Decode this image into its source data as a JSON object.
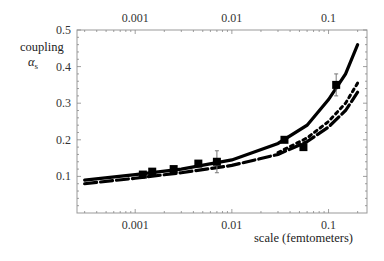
{
  "chart_data": {
    "type": "line",
    "title": "",
    "xlabel": "scale (femtometers)",
    "ylabel": "coupling",
    "ylabel_symbol": "α",
    "ylabel_subscript": "s",
    "xscale": "log",
    "xlim": [
      0.00025,
      0.25
    ],
    "ylim": [
      0.0,
      0.5
    ],
    "x_ticks": [
      0.001,
      0.01,
      0.1
    ],
    "x_tick_labels": [
      "0.001",
      "0.01",
      "0.1"
    ],
    "top_x_tick_labels": [
      "0.001",
      "0.01",
      "0.1"
    ],
    "y_ticks": [
      0.1,
      0.2,
      0.3,
      0.4,
      0.5
    ],
    "y_tick_labels": [
      "0.1",
      "0.2",
      "0.3",
      "0.4",
      "0.5"
    ],
    "grid": false,
    "legend": null,
    "series": [
      {
        "name": "theory (solid)",
        "style": "solid",
        "x": [
          0.0003,
          0.001,
          0.003,
          0.01,
          0.03,
          0.06,
          0.1,
          0.15,
          0.2
        ],
        "y": [
          0.09,
          0.105,
          0.12,
          0.145,
          0.19,
          0.24,
          0.31,
          0.38,
          0.46
        ]
      },
      {
        "name": "theory (dashed)",
        "style": "dashed",
        "x": [
          0.0003,
          0.001,
          0.003,
          0.01,
          0.03,
          0.06,
          0.1,
          0.15,
          0.2
        ],
        "y": [
          0.08,
          0.095,
          0.11,
          0.13,
          0.16,
          0.195,
          0.235,
          0.28,
          0.33
        ]
      },
      {
        "name": "theory (dotted)",
        "style": "dotted",
        "x": [
          0.03,
          0.06,
          0.1,
          0.15,
          0.2
        ],
        "y": [
          0.165,
          0.205,
          0.25,
          0.3,
          0.355
        ]
      },
      {
        "name": "measurements",
        "style": "markers",
        "x": [
          0.0012,
          0.0015,
          0.0025,
          0.0045,
          0.007,
          0.035,
          0.055,
          0.12
        ],
        "y": [
          0.105,
          0.113,
          0.12,
          0.135,
          0.14,
          0.2,
          0.18,
          0.35
        ],
        "error": [
          0.005,
          0.005,
          0.006,
          0.008,
          0.03,
          0.008,
          0.008,
          0.03
        ]
      }
    ]
  }
}
